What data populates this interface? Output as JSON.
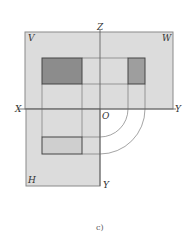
{
  "diagram": {
    "caption": "c)",
    "labels": {
      "V": "V",
      "W": "W",
      "H": "H",
      "Z": "Z",
      "X": "X",
      "O": "O",
      "Y_right": "Y",
      "Y_bottom": "Y"
    },
    "colors": {
      "panel_fill": "#dcdcdc",
      "panel_stroke": "#8a8a8a",
      "front_view_fill": "#8c8c8c",
      "side_view_fill": "#9e9e9e",
      "top_view_fill": "#cfcfcf",
      "line": "#555555"
    },
    "planes": [
      "V (frontal)",
      "W (profile)",
      "H (horizontal)"
    ],
    "projections": {
      "front_view": {
        "x": 42,
        "y": 58,
        "w": 40,
        "h": 26
      },
      "side_view": {
        "x": 128,
        "y": 58,
        "w": 17,
        "h": 26
      },
      "top_view": {
        "x": 42,
        "y": 137,
        "w": 40,
        "h": 17
      }
    }
  }
}
